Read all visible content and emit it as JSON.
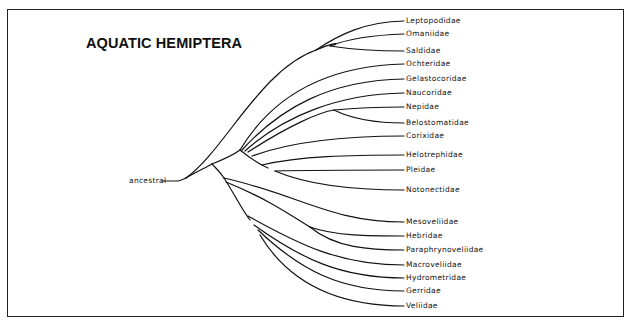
{
  "title": "AQUATIC HEMIPTERA",
  "root_label": "ancestral",
  "colors": {
    "line": "#111111",
    "background": "#ffffff"
  },
  "taxa": [
    {
      "name": "Leptopodidae",
      "y": 21
    },
    {
      "name": "Omaniidae",
      "y": 34
    },
    {
      "name": "Saldidae",
      "y": 51
    },
    {
      "name": "Ochteridae",
      "y": 64
    },
    {
      "name": "Gelastocoridae",
      "y": 79
    },
    {
      "name": "Naucoridae",
      "y": 93
    },
    {
      "name": "Nepidae",
      "y": 107
    },
    {
      "name": "Belostomatidae",
      "y": 123
    },
    {
      "name": "Corixidae",
      "y": 136
    },
    {
      "name": "Helotrephidae",
      "y": 155
    },
    {
      "name": "Pleidae",
      "y": 170
    },
    {
      "name": "Notonectidae",
      "y": 190
    },
    {
      "name": "Mesoveliidae",
      "y": 222
    },
    {
      "name": "Hebridae",
      "y": 236
    },
    {
      "name": "Paraphrynoveliidae",
      "y": 250
    },
    {
      "name": "Macroveliidae",
      "y": 265
    },
    {
      "name": "Hydrometridae",
      "y": 278
    },
    {
      "name": "Gerridae",
      "y": 291
    },
    {
      "name": "Veliidae",
      "y": 306
    }
  ],
  "clades": {
    "leptopodomorpha": [
      "Leptopodidae",
      "Omaniidae",
      "Saldidae"
    ],
    "nepomorpha": [
      "Ochteridae",
      "Gelastocoridae",
      "Naucoridae",
      "Nepidae",
      "Belostomatidae",
      "Corixidae",
      "Helotrephidae",
      "Pleidae",
      "Notonectidae"
    ],
    "gerromorpha": [
      "Mesoveliidae",
      "Hebridae",
      "Paraphrynoveliidae",
      "Macroveliidae",
      "Hydrometridae",
      "Gerridae",
      "Veliidae"
    ]
  }
}
